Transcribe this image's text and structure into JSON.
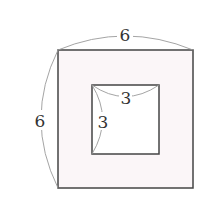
{
  "diagram": {
    "type": "square-with-square-hole",
    "outer_square": {
      "side_label": "6",
      "top_label": "6",
      "left_label": "6",
      "fill": "#fbf6f8",
      "stroke": "#444444"
    },
    "inner_square": {
      "top_label": "3",
      "left_label": "3",
      "fill": "#ffffff",
      "stroke": "#444444"
    },
    "dimension_arc_color": "#9a9a9a"
  }
}
